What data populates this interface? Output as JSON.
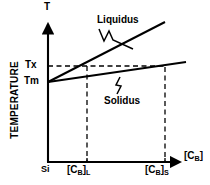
{
  "figure": {
    "kind": "phase-diagram",
    "background_color": "#ffffff",
    "line_color": "#000000"
  },
  "axes": {
    "y_axis_symbol": "T",
    "y_axis_title": "TEMPERATURE",
    "x_axis_symbol_prefix": "[C",
    "x_axis_symbol_sub": "B",
    "x_axis_symbol_suffix": "]"
  },
  "y_ticks": [
    {
      "label": "Tx",
      "y_px": 66
    },
    {
      "label": "Tm",
      "y_px": 82
    }
  ],
  "x_ticks": [
    {
      "label_prefix": "Si",
      "label_sub": "",
      "label_suffix": "",
      "x_px": 48
    },
    {
      "label_prefix": "[C",
      "label_sub": "B",
      "label_suffix": "]",
      "label_post_sub": "L",
      "x_px": 87
    },
    {
      "label_prefix": "[C",
      "label_sub": "B",
      "label_suffix": "]",
      "label_post_sub": "S",
      "x_px": 165
    }
  ],
  "curves": [
    {
      "name": "Liquidus",
      "label": "Liquidus",
      "start": [
        48,
        82
      ],
      "end": [
        165,
        22
      ],
      "style": "solid"
    },
    {
      "name": "Solidus",
      "label": "Solidus",
      "start": [
        48,
        82
      ],
      "end": [
        186,
        62
      ],
      "style": "solid"
    }
  ],
  "construction_lines": [
    {
      "name": "tx-horizontal",
      "from": [
        48,
        66
      ],
      "to": [
        166,
        66
      ],
      "style": "dashed"
    },
    {
      "name": "cbl-vertical",
      "from": [
        87,
        66
      ],
      "to": [
        87,
        162
      ],
      "style": "dashed"
    },
    {
      "name": "cbs-vertical",
      "from": [
        165,
        67
      ],
      "to": [
        165,
        162
      ],
      "style": "dashed"
    }
  ]
}
